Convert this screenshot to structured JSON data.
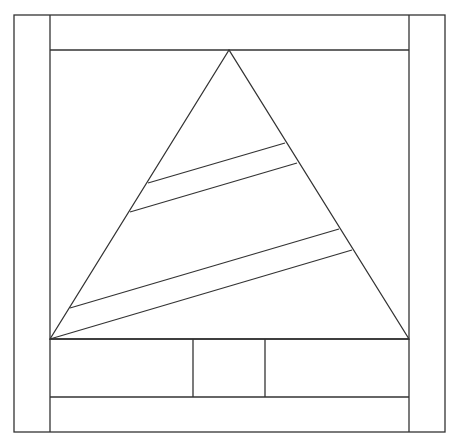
{
  "diagram": {
    "stroke_color": "#333333",
    "background": "#ffffff",
    "outer_frame": {
      "x1": 14,
      "y1": 15,
      "x2": 445,
      "y2": 432
    },
    "left_border_x": 50,
    "right_border_x": 409,
    "top_band_y": 50,
    "base_y": 339,
    "bottom_band_y": 397,
    "tree": {
      "apex": [
        229,
        50
      ],
      "left": [
        50,
        339
      ],
      "right": [
        409,
        339
      ]
    },
    "stripes": [
      {
        "x1": 148,
        "y1": 183,
        "x2": 285,
        "y2": 143
      },
      {
        "x1": 130,
        "y1": 212,
        "x2": 297,
        "y2": 163
      },
      {
        "x1": 70,
        "y1": 308,
        "x2": 339,
        "y2": 229
      },
      {
        "x1": 50,
        "y1": 339,
        "x2": 352,
        "y2": 250
      }
    ],
    "trunk": {
      "left_x": 193,
      "right_x": 265
    }
  }
}
